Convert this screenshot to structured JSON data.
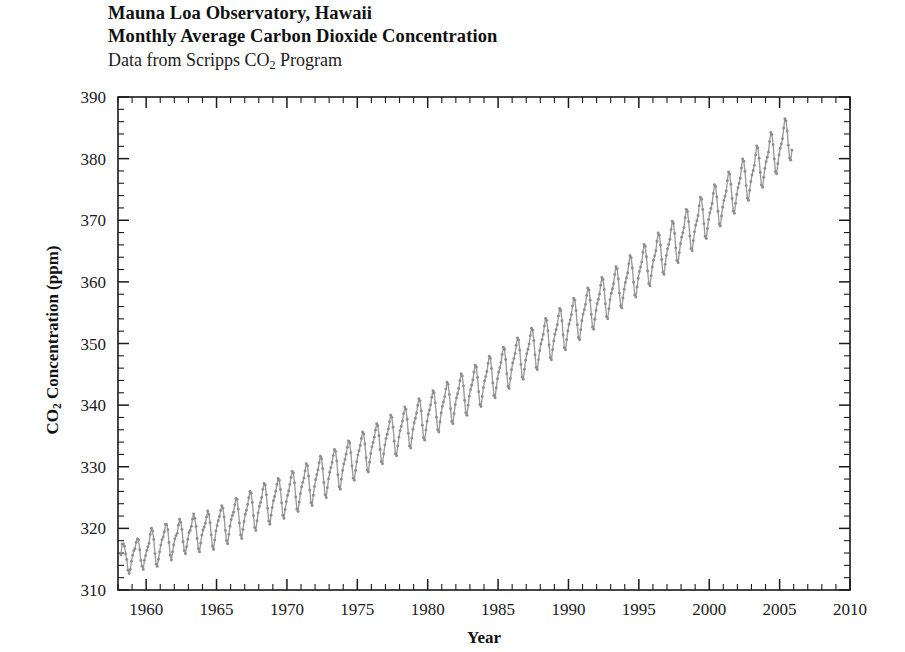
{
  "title": {
    "line1": "Mauna Loa Observatory, Hawaii",
    "line2": "Monthly Average Carbon Dioxide Concentration",
    "line3_prefix": "Data from Scripps CO",
    "line3_sub": "2",
    "line3_suffix": " Program"
  },
  "axes": {
    "x_title": "Year",
    "y_title_prefix": "CO",
    "y_title_sub": "2",
    "y_title_suffix": " Concentration (ppm)"
  },
  "colors": {
    "line": "#9a9a9a",
    "marker": "#8e8e8e",
    "axis": "#1a1a1a",
    "background": "#ffffff"
  },
  "chart_data": {
    "type": "line",
    "subtitle": "Data from Scripps CO2 Program",
    "xlabel": "Year",
    "ylabel": "CO2 Concentration (ppm)",
    "xlim": [
      1958,
      2010
    ],
    "ylim": [
      310,
      390
    ],
    "x_ticks": [
      1960,
      1965,
      1970,
      1975,
      1980,
      1985,
      1990,
      1995,
      2000,
      2005,
      2010
    ],
    "y_ticks": [
      310,
      320,
      330,
      340,
      350,
      360,
      370,
      380,
      390
    ],
    "x_minor_step": 1,
    "y_minor_step": 2,
    "grid": false,
    "legend": false,
    "marker": "circle",
    "series": [
      {
        "name": "Monthly average CO2 (ppm)",
        "color": "#9a9a9a",
        "x_start": 1958.208,
        "x_step": 0.08333,
        "values": [
          315.71,
          317.45,
          317.5,
          317.1,
          315.86,
          314.93,
          313.2,
          312.66,
          313.33,
          314.67,
          315.62,
          316.38,
          316.71,
          317.72,
          318.29,
          318.15,
          316.54,
          314.8,
          313.84,
          313.33,
          314.81,
          315.58,
          316.43,
          316.98,
          317.58,
          319.02,
          320.03,
          319.59,
          318.18,
          315.91,
          314.16,
          313.83,
          315.0,
          316.19,
          317.29,
          318.16,
          318.62,
          319.43,
          320.69,
          320.58,
          319.77,
          317.7,
          315.64,
          314.87,
          316.19,
          317.31,
          318.3,
          318.82,
          319.19,
          320.5,
          321.48,
          320.97,
          319.85,
          317.84,
          316.38,
          315.88,
          317.03,
          318.22,
          319.31,
          319.66,
          320.34,
          321.49,
          322.36,
          321.63,
          320.31,
          318.35,
          316.71,
          316.18,
          317.6,
          318.91,
          319.74,
          320.22,
          320.86,
          321.86,
          322.83,
          322.27,
          320.92,
          318.95,
          317.1,
          316.58,
          318.13,
          319.57,
          320.44,
          321.25,
          321.94,
          322.89,
          323.69,
          323.29,
          321.83,
          319.66,
          318.0,
          317.49,
          319.02,
          320.35,
          321.42,
          322.09,
          322.63,
          323.82,
          324.87,
          324.71,
          323.13,
          320.88,
          318.92,
          318.36,
          319.82,
          321.13,
          322.29,
          322.93,
          323.87,
          324.96,
          326.01,
          325.69,
          324.2,
          322.04,
          320.13,
          319.64,
          321.21,
          322.52,
          323.56,
          324.2,
          325.01,
          326.33,
          327.31,
          327.05,
          325.44,
          323.25,
          321.19,
          320.66,
          322.12,
          323.37,
          324.49,
          325.19,
          326.02,
          327.13,
          328.09,
          327.8,
          326.31,
          324.12,
          322.12,
          321.62,
          323.07,
          324.34,
          325.34,
          326.07,
          327.1,
          328.27,
          329.25,
          328.98,
          327.41,
          325.08,
          323.12,
          322.73,
          324.28,
          325.64,
          326.73,
          327.47,
          328.18,
          329.35,
          330.48,
          330.19,
          328.49,
          326.21,
          324.15,
          323.72,
          325.37,
          326.79,
          327.89,
          328.69,
          329.49,
          330.66,
          331.72,
          331.31,
          329.71,
          327.44,
          325.44,
          325.02,
          326.61,
          328.03,
          329.11,
          329.86,
          330.69,
          331.81,
          332.81,
          332.5,
          330.94,
          328.69,
          326.73,
          326.36,
          327.97,
          329.38,
          330.46,
          331.18,
          332.03,
          333.16,
          334.2,
          333.9,
          332.3,
          330.11,
          328.14,
          327.79,
          329.41,
          330.82,
          331.89,
          332.6,
          333.44,
          334.58,
          335.64,
          335.31,
          333.7,
          331.47,
          329.47,
          329.13,
          330.75,
          332.17,
          333.23,
          333.95,
          334.78,
          335.94,
          336.99,
          336.66,
          335.05,
          332.81,
          330.81,
          330.47,
          332.09,
          333.51,
          334.57,
          335.28,
          336.11,
          337.29,
          338.35,
          338.02,
          336.4,
          334.14,
          332.12,
          331.77,
          333.39,
          334.81,
          335.87,
          336.58,
          337.41,
          338.62,
          339.69,
          339.35,
          337.71,
          335.42,
          333.38,
          333.03,
          334.66,
          336.09,
          337.16,
          337.88,
          338.71,
          339.94,
          341.03,
          340.69,
          339.04,
          336.73,
          334.67,
          334.32,
          335.95,
          337.39,
          338.47,
          339.19,
          340.02,
          341.26,
          342.36,
          342.02,
          340.37,
          338.05,
          335.99,
          335.64,
          337.27,
          338.71,
          339.79,
          340.51,
          341.34,
          342.6,
          343.71,
          343.37,
          341.72,
          339.4,
          337.34,
          336.99,
          338.62,
          340.06,
          341.14,
          341.86,
          342.69,
          343.96,
          345.08,
          344.74,
          343.09,
          340.77,
          338.71,
          338.36,
          339.99,
          341.43,
          342.51,
          343.23,
          344.06,
          345.35,
          346.48,
          346.14,
          344.49,
          342.17,
          340.11,
          339.76,
          341.39,
          342.83,
          343.91,
          344.63,
          345.46,
          346.77,
          347.92,
          347.58,
          345.93,
          343.61,
          341.55,
          341.2,
          342.83,
          344.27,
          345.35,
          346.07,
          346.9,
          348.23,
          349.4,
          349.06,
          347.41,
          345.09,
          343.03,
          342.68,
          344.31,
          345.75,
          346.83,
          347.55,
          348.38,
          349.73,
          350.92,
          350.58,
          348.93,
          346.61,
          344.55,
          344.2,
          345.83,
          347.27,
          348.35,
          349.07,
          349.9,
          351.27,
          352.48,
          352.14,
          350.49,
          348.17,
          346.11,
          345.76,
          347.39,
          348.83,
          349.91,
          350.63,
          351.46,
          352.85,
          354.07,
          353.73,
          352.08,
          349.76,
          347.7,
          347.35,
          348.98,
          350.42,
          351.5,
          352.22,
          353.05,
          354.46,
          355.69,
          355.35,
          353.7,
          351.38,
          349.32,
          348.97,
          350.6,
          352.04,
          353.12,
          353.84,
          354.67,
          356.1,
          357.34,
          357.0,
          355.35,
          353.03,
          350.97,
          350.62,
          352.25,
          353.69,
          354.77,
          355.49,
          356.32,
          357.77,
          359.02,
          358.68,
          357.03,
          354.71,
          352.65,
          352.3,
          353.93,
          355.37,
          356.45,
          357.17,
          358.0,
          359.47,
          360.73,
          360.39,
          358.74,
          356.42,
          354.36,
          354.01,
          355.64,
          357.08,
          358.16,
          358.88,
          359.71,
          361.2,
          362.47,
          362.13,
          360.48,
          358.16,
          356.1,
          355.75,
          357.38,
          358.82,
          359.9,
          360.62,
          361.45,
          362.96,
          364.25,
          363.91,
          362.26,
          359.94,
          357.88,
          357.53,
          359.16,
          360.6,
          361.68,
          362.4,
          363.23,
          364.76,
          366.07,
          365.73,
          364.08,
          361.76,
          359.7,
          359.35,
          360.98,
          362.42,
          363.5,
          364.22,
          365.05,
          366.6,
          367.93,
          367.59,
          365.94,
          363.62,
          361.56,
          361.21,
          362.84,
          364.28,
          365.36,
          366.08,
          366.91,
          368.48,
          369.83,
          369.49,
          367.84,
          365.52,
          363.46,
          363.11,
          364.74,
          366.18,
          367.26,
          367.98,
          368.81,
          370.4,
          371.77,
          371.43,
          369.78,
          367.46,
          365.4,
          365.05,
          366.68,
          368.12,
          369.2,
          369.92,
          370.75,
          372.36,
          373.75,
          373.41,
          371.76,
          369.44,
          367.38,
          367.03,
          368.66,
          370.1,
          371.18,
          371.9,
          372.73,
          374.36,
          375.77,
          375.43,
          373.78,
          371.46,
          369.4,
          369.05,
          370.68,
          372.12,
          373.2,
          373.92,
          374.75,
          376.4,
          377.83,
          377.49,
          375.84,
          373.52,
          371.46,
          371.11,
          372.74,
          374.18,
          375.26,
          375.98,
          376.81,
          378.48,
          379.93,
          379.59,
          377.94,
          375.62,
          373.56,
          373.21,
          374.84,
          376.28,
          377.36,
          378.08,
          378.91,
          380.6,
          382.07,
          381.73,
          380.08,
          377.76,
          375.7,
          375.35,
          376.98,
          378.42,
          379.5,
          380.22,
          381.05,
          382.76,
          384.25,
          383.91,
          382.26,
          379.94,
          377.88,
          377.53,
          379.16,
          380.6,
          381.68,
          382.4,
          383.23,
          384.96,
          386.47,
          386.13,
          384.48,
          382.16,
          380.1,
          379.75,
          381.38
        ]
      }
    ]
  }
}
